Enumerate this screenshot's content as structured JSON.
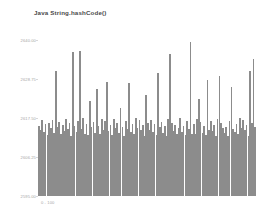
{
  "chart_data": {
    "type": "bar",
    "title": "Java String.hashCode()",
    "xlabel": "0 - 100",
    "ylabel": "",
    "ylim": [
      2595.0,
      2640.0
    ],
    "grid": false,
    "legend": null,
    "bar_color": "#8c8c8c",
    "yticks": [
      2640.0,
      2628.75,
      2617.5,
      2606.25,
      2595.0
    ],
    "ytick_labels": [
      "2640.00",
      "2628.75",
      "2617.50",
      "2606.25",
      "2595.00"
    ],
    "categories": [
      "0",
      "1",
      "2",
      "3",
      "4",
      "5",
      "6",
      "7",
      "8",
      "9",
      "10",
      "11",
      "12",
      "13",
      "14",
      "15",
      "16",
      "17",
      "18",
      "19",
      "20",
      "21",
      "22",
      "23",
      "24",
      "25",
      "26",
      "27",
      "28",
      "29",
      "30",
      "31",
      "32",
      "33",
      "34",
      "35",
      "36",
      "37",
      "38",
      "39",
      "40",
      "41",
      "42",
      "43",
      "44",
      "45",
      "46",
      "47",
      "48",
      "49",
      "50",
      "51",
      "52",
      "53",
      "54",
      "55",
      "56",
      "57",
      "58",
      "59",
      "60",
      "61",
      "62",
      "63",
      "64",
      "65",
      "66",
      "67",
      "68",
      "69",
      "70",
      "71",
      "72",
      "73",
      "74",
      "75",
      "76",
      "77",
      "78",
      "79",
      "80",
      "81",
      "82",
      "83",
      "84",
      "85",
      "86",
      "87",
      "88",
      "89",
      "90",
      "91",
      "92",
      "93",
      "94",
      "95",
      "96",
      "97",
      "98",
      "99",
      "100",
      "101",
      "102",
      "103",
      "104",
      "105",
      "106",
      "107",
      "108",
      "109",
      "110",
      "111",
      "112",
      "113",
      "114",
      "115",
      "116",
      "117",
      "118",
      "119",
      "120",
      "121",
      "122",
      "123",
      "124",
      "125",
      "126",
      "127"
    ],
    "values": [
      2615.2,
      2614.0,
      2616.8,
      2613.4,
      2615.9,
      2612.7,
      2616.2,
      2614.6,
      2617.0,
      2613.1,
      2631.2,
      2614.8,
      2616.4,
      2612.9,
      2615.5,
      2613.8,
      2617.2,
      2614.2,
      2616.0,
      2612.4,
      2636.5,
      2615.1,
      2613.6,
      2616.6,
      2636.9,
      2614.4,
      2617.4,
      2613.0,
      2615.7,
      2612.6,
      2622.5,
      2614.9,
      2616.3,
      2613.3,
      2626.0,
      2615.3,
      2612.8,
      2617.1,
      2614.1,
      2616.5,
      2628.0,
      2613.7,
      2615.6,
      2612.5,
      2617.3,
      2614.5,
      2616.1,
      2613.2,
      2620.5,
      2615.0,
      2612.3,
      2616.7,
      2614.3,
      2627.5,
      2613.5,
      2615.8,
      2612.9,
      2617.5,
      2614.7,
      2616.9,
      2613.9,
      2615.4,
      2612.2,
      2624.0,
      2616.2,
      2614.0,
      2617.0,
      2613.4,
      2615.9,
      2612.7,
      2630.5,
      2614.8,
      2616.4,
      2613.1,
      2615.2,
      2612.4,
      2617.2,
      2636.0,
      2616.0,
      2613.8,
      2615.5,
      2612.9,
      2614.6,
      2617.4,
      2613.6,
      2615.1,
      2612.6,
      2616.6,
      2614.4,
      2639.5,
      2613.0,
      2615.7,
      2612.8,
      2617.1,
      2623.0,
      2616.3,
      2613.3,
      2615.3,
      2612.5,
      2628.5,
      2614.1,
      2616.5,
      2613.7,
      2615.6,
      2612.3,
      2617.3,
      2629.5,
      2616.1,
      2614.5,
      2613.2,
      2615.0,
      2612.2,
      2616.7,
      2626.5,
      2614.3,
      2613.5,
      2615.8,
      2612.9,
      2617.5,
      2614.7,
      2616.9,
      2613.9,
      2615.4,
      2612.2,
      2631.0,
      2616.2,
      2634.5,
      2615.0
    ]
  }
}
